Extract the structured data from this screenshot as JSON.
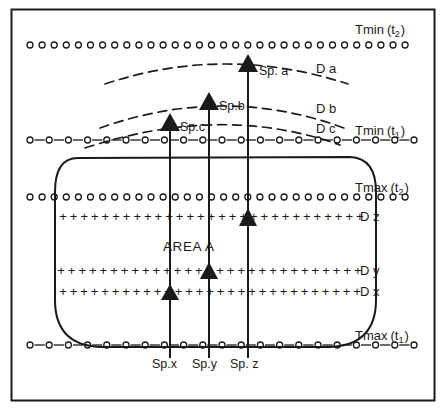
{
  "figure": {
    "area_label": "AREA   A",
    "frame": {
      "stroke": "#1a1a1a"
    },
    "isotherms": [
      {
        "key": "tmin_t2",
        "label": "Tmin",
        "sub": "2",
        "paren_open": "(t",
        "paren_close": ")",
        "style": "open-circles",
        "y": 45
      },
      {
        "key": "tmin_t1",
        "label": "Tmin",
        "sub": "1",
        "paren_open": "(t",
        "paren_close": ")",
        "style": "dash-circles",
        "y": 140
      },
      {
        "key": "tmax_t2",
        "label": "Tmax",
        "sub": "2",
        "paren_open": "(t",
        "paren_close": ")",
        "style": "open-circles",
        "y": 197
      },
      {
        "key": "tmax_t1",
        "label": "Tmax",
        "sub": "1",
        "paren_open": "(t",
        "paren_close": ")",
        "style": "dash-circles",
        "y": 345
      }
    ],
    "dispersal_arcs": [
      {
        "key": "da",
        "label": "D a",
        "label_x": 316,
        "label_y": 73,
        "apex_y": 62
      },
      {
        "key": "db",
        "label": "D b",
        "label_x": 316,
        "label_y": 113,
        "apex_y": 100
      },
      {
        "key": "dc",
        "label": "D c",
        "label_x": 316,
        "label_y": 133,
        "apex_y": 120
      }
    ],
    "plus_rows": [
      {
        "key": "dz",
        "label": "D z",
        "y": 216,
        "label_x": 360,
        "label_y": 221
      },
      {
        "key": "dy",
        "label": "D y",
        "y": 270,
        "label_x": 360,
        "label_y": 275
      },
      {
        "key": "dx",
        "label": "D x",
        "y": 291,
        "label_x": 360,
        "label_y": 296
      }
    ],
    "arrow_columns": [
      {
        "key": "spx_spc",
        "x": 170,
        "bottom_label": "Sp.x",
        "bottom_label_x": 152,
        "bottom_label_y": 368,
        "inner_head_y": 291,
        "top_label": "Sp.c",
        "top_label_x": 180,
        "top_label_y": 131,
        "top_head_y": 120
      },
      {
        "key": "spy_spb",
        "x": 209,
        "bottom_label": "Sp.y",
        "bottom_label_x": 192,
        "bottom_label_y": 368,
        "inner_head_y": 270,
        "top_label": "Sp.b",
        "top_label_x": 219,
        "top_label_y": 110,
        "top_head_y": 100
      },
      {
        "key": "spz_spa",
        "x": 248,
        "bottom_label": "Sp. z",
        "bottom_label_x": 230,
        "bottom_label_y": 368,
        "inner_head_y": 216,
        "top_label": "Sp. a",
        "top_label_x": 259,
        "top_label_y": 75,
        "top_head_y": 62
      }
    ]
  }
}
